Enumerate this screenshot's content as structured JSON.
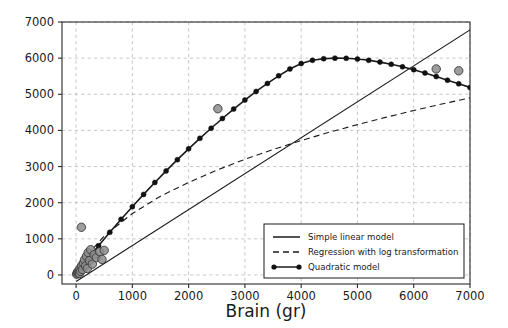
{
  "chart_data": {
    "type": "line",
    "title": "",
    "subtitle": "",
    "xlabel": "Brain (gr)",
    "ylabel": "",
    "xlim": [
      -250,
      7000
    ],
    "ylim": [
      -250,
      7000
    ],
    "xticks": [
      0,
      1000,
      2000,
      3000,
      4000,
      5000,
      6000,
      7000
    ],
    "yticks": [
      0,
      1000,
      2000,
      3000,
      4000,
      5000,
      6000,
      7000
    ],
    "xtick_labels": [
      "0",
      "1000",
      "2000",
      "3000",
      "4000",
      "5000",
      "6000",
      "7000"
    ],
    "ytick_labels": [
      "0",
      "1000",
      "2000",
      "3000",
      "4000",
      "5000",
      "6000",
      "7000"
    ],
    "grid": true,
    "legend_position": "lower right",
    "colors": {
      "line": "#1a1a1a",
      "marker_face": "#8c8c8c",
      "marker_edge": "#3a3a3a",
      "grid": "#b9b9b9",
      "axis": "#2a2a2a",
      "background": "#ffffff"
    },
    "series": [
      {
        "name": "Simple linear model",
        "style": "solid",
        "x": [
          0,
          7000
        ],
        "values": [
          -180,
          6780
        ]
      },
      {
        "name": "Regression with log transformation",
        "style": "dashed",
        "x": [
          0,
          250,
          500,
          1000,
          1500,
          2000,
          2500,
          3000,
          3500,
          4000,
          4500,
          5000,
          5500,
          6000,
          6500,
          7000
        ],
        "values": [
          60,
          640,
          1080,
          1700,
          2180,
          2560,
          2900,
          3200,
          3470,
          3720,
          3950,
          4160,
          4360,
          4550,
          4730,
          4900
        ]
      },
      {
        "name": "Quadratic model",
        "style": "solid-with-markers",
        "x": [
          0,
          200,
          400,
          600,
          800,
          1000,
          1200,
          1400,
          1600,
          1800,
          2000,
          2200,
          2400,
          2600,
          2800,
          3000,
          3200,
          3400,
          3600,
          3800,
          4000,
          4200,
          4400,
          4600,
          4800,
          5000,
          5200,
          5400,
          5600,
          5800,
          6000,
          6200,
          6400,
          6600,
          6800,
          7000
        ],
        "values": [
          40,
          430,
          810,
          1180,
          1540,
          1890,
          2230,
          2560,
          2880,
          3190,
          3490,
          3780,
          4060,
          4330,
          4590,
          4840,
          5080,
          5300,
          5510,
          5700,
          5850,
          5940,
          5985,
          6000,
          5995,
          5975,
          5940,
          5890,
          5830,
          5760,
          5680,
          5590,
          5490,
          5390,
          5290,
          5190
        ]
      }
    ],
    "scatter": {
      "name": "Observations",
      "points": [
        {
          "x": 10,
          "y": 20
        },
        {
          "x": 20,
          "y": 55
        },
        {
          "x": 30,
          "y": 90
        },
        {
          "x": 40,
          "y": 60
        },
        {
          "x": 55,
          "y": 130
        },
        {
          "x": 60,
          "y": 40
        },
        {
          "x": 70,
          "y": 180
        },
        {
          "x": 80,
          "y": 100
        },
        {
          "x": 95,
          "y": 1320
        },
        {
          "x": 100,
          "y": 260
        },
        {
          "x": 115,
          "y": 150
        },
        {
          "x": 130,
          "y": 330
        },
        {
          "x": 150,
          "y": 420
        },
        {
          "x": 170,
          "y": 250
        },
        {
          "x": 185,
          "y": 520
        },
        {
          "x": 200,
          "y": 180
        },
        {
          "x": 215,
          "y": 620
        },
        {
          "x": 240,
          "y": 400
        },
        {
          "x": 260,
          "y": 700
        },
        {
          "x": 290,
          "y": 300
        },
        {
          "x": 320,
          "y": 560
        },
        {
          "x": 360,
          "y": 480
        },
        {
          "x": 420,
          "y": 640
        },
        {
          "x": 460,
          "y": 430
        },
        {
          "x": 500,
          "y": 680
        },
        {
          "x": 2520,
          "y": 4600
        },
        {
          "x": 6400,
          "y": 5700
        },
        {
          "x": 6800,
          "y": 5650
        }
      ]
    },
    "legend_entries": [
      {
        "label": "Simple linear model",
        "style": "solid"
      },
      {
        "label": "Regression with log transformation",
        "style": "dashed"
      },
      {
        "label": "Quadratic model",
        "style": "solid-with-markers"
      }
    ]
  }
}
